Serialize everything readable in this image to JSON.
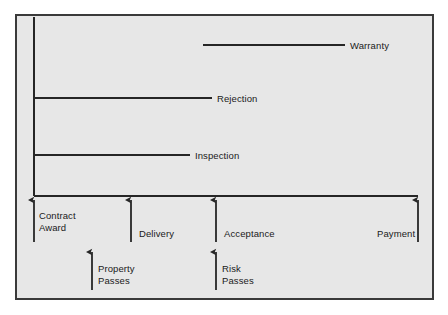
{
  "diagram": {
    "background_color": "#e7e7e7",
    "page_color": "#ffffff",
    "line_color": "#262626",
    "border_color": "#3a3a3a",
    "text_color": "#1a1a1a"
  },
  "axes": {
    "vertical": {
      "x": 34,
      "y_top": 17,
      "y_bottom": 196
    },
    "horizontal": {
      "y": 196,
      "x_start": 34,
      "x_end": 418
    }
  },
  "phases": [
    {
      "id": "warranty",
      "label": "Warranty",
      "line": {
        "x_start": 203,
        "x_end": 345,
        "y": 45
      },
      "label_x": 350,
      "label_y": 40
    },
    {
      "id": "rejection",
      "label": "Rejection",
      "line": {
        "x_start": 34,
        "x_end": 212,
        "y": 98
      },
      "label_x": 217,
      "label_y": 93
    },
    {
      "id": "inspection",
      "label": "Inspection",
      "line": {
        "x_start": 34,
        "x_end": 190,
        "y": 155
      },
      "label_x": 195,
      "label_y": 150
    }
  ],
  "milestones": [
    {
      "id": "contract-award",
      "label_lines": [
        "Contract",
        "Award"
      ],
      "arrow": {
        "x": 34,
        "y_tail": 242,
        "y_head": 200
      },
      "label_x": 39,
      "label_y": 210,
      "row": "upper"
    },
    {
      "id": "delivery",
      "label_lines": [
        "Delivery"
      ],
      "arrow": {
        "x": 131,
        "y_tail": 242,
        "y_head": 200
      },
      "label_x": 139,
      "label_y": 228,
      "row": "upper"
    },
    {
      "id": "acceptance",
      "label_lines": [
        "Acceptance"
      ],
      "arrow": {
        "x": 216,
        "y_tail": 242,
        "y_head": 200
      },
      "label_x": 224,
      "label_y": 228,
      "row": "upper"
    },
    {
      "id": "payment",
      "label_lines": [
        "Payment"
      ],
      "arrow": {
        "x": 418,
        "y_tail": 242,
        "y_head": 200
      },
      "label_x": 377,
      "label_y": 228,
      "row": "upper"
    },
    {
      "id": "property-passes",
      "label_lines": [
        "Property",
        "Passes"
      ],
      "arrow": {
        "x": 92,
        "y_tail": 290,
        "y_head": 252
      },
      "label_x": 98,
      "label_y": 263,
      "row": "lower"
    },
    {
      "id": "risk-passes",
      "label_lines": [
        "Risk",
        "Passes"
      ],
      "arrow": {
        "x": 216,
        "y_tail": 290,
        "y_head": 252
      },
      "label_x": 222,
      "label_y": 263,
      "row": "lower"
    }
  ]
}
